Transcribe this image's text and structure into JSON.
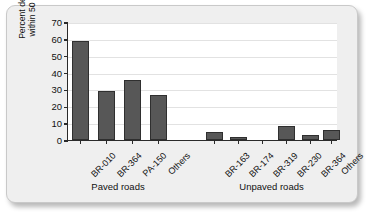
{
  "chart_data": {
    "type": "bar",
    "title": "",
    "xlabel": "",
    "ylabel": "Percent deforestation within 50 km of road",
    "ylabel_line1": "Percent deforestation",
    "ylabel_line2": "within 50 km of road",
    "ylim": [
      0,
      70
    ],
    "ytick_labels": [
      "0",
      "10",
      "20",
      "30",
      "40",
      "50",
      "60",
      "70"
    ],
    "ytick_values": [
      0,
      10,
      20,
      30,
      40,
      50,
      60,
      70
    ],
    "grid": "horizontal",
    "legend": "none",
    "bar_color": "#575757",
    "bar_edge_color": "#2f2f2f",
    "axis_color": "#2a2a2a",
    "plot_background": "#ffffff",
    "card_background": "#efefef",
    "categories": [
      "BR-010",
      "BR-364",
      "PA-150",
      "Others",
      "BR-163",
      "BR-174",
      "BR-319",
      "BR-230",
      "BR-364",
      "Others"
    ],
    "values": [
      59,
      29,
      35.5,
      27,
      5,
      1.5,
      0,
      8.5,
      3,
      6
    ],
    "groups": [
      {
        "label": "Paved roads",
        "categories": [
          "BR-010",
          "BR-364",
          "PA-150",
          "Others"
        ],
        "values": [
          59,
          29,
          35.5,
          27
        ]
      },
      {
        "label": "Unpaved roads",
        "categories": [
          "BR-163",
          "BR-174",
          "BR-319",
          "BR-230",
          "BR-364",
          "Others"
        ],
        "values": [
          5,
          1.5,
          0,
          8.5,
          3,
          6
        ]
      }
    ]
  }
}
